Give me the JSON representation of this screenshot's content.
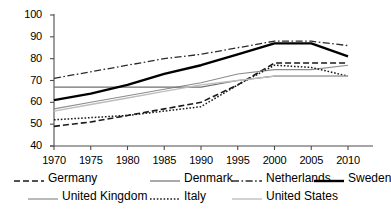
{
  "chart_data": {
    "type": "line",
    "title": "",
    "xlabel": "",
    "ylabel": "",
    "x": [
      1970,
      1975,
      1980,
      1985,
      1990,
      1995,
      2000,
      2005,
      2010
    ],
    "xlim": [
      1968,
      2012
    ],
    "ylim": [
      40,
      100
    ],
    "yticks": [
      40,
      50,
      60,
      70,
      80,
      90,
      100
    ],
    "xticks": [
      1970,
      1975,
      1980,
      1985,
      1990,
      1995,
      2000,
      2005,
      2010
    ],
    "grid": false,
    "legend_position": "below",
    "series": [
      {
        "name": "Germany",
        "style": "dashed",
        "color": "#1a1a1a",
        "width": 1.6,
        "values": [
          49,
          51,
          54,
          57,
          60,
          68,
          78,
          78,
          78
        ]
      },
      {
        "name": "United Kingdom",
        "style": "solid",
        "color": "#8c8c8c",
        "width": 1.1,
        "values": [
          57,
          60,
          63,
          66,
          69,
          73,
          75,
          75,
          77
        ]
      },
      {
        "name": "Denmark",
        "style": "solid",
        "color": "#707070",
        "width": 1.2,
        "values": [
          67,
          67,
          67,
          67,
          67,
          70,
          72,
          72,
          72
        ]
      },
      {
        "name": "Italy",
        "style": "dotted",
        "color": "#1a1a1a",
        "width": 1.5,
        "values": [
          52,
          53,
          54,
          56,
          58,
          68,
          77,
          76,
          72
        ]
      },
      {
        "name": "Netherlands",
        "style": "dash-dot",
        "color": "#2b2b2b",
        "width": 1.3,
        "values": [
          71,
          74,
          77,
          80,
          82,
          85,
          88,
          88,
          86
        ]
      },
      {
        "name": "United States",
        "style": "solid",
        "color": "#bdbdbd",
        "width": 1.4,
        "values": [
          56,
          59,
          62,
          65,
          68,
          70,
          72,
          72,
          72
        ]
      },
      {
        "name": "Sweden",
        "style": "solid",
        "color": "#000000",
        "width": 2.4,
        "values": [
          61,
          64,
          68,
          73,
          77,
          82,
          87,
          87,
          81
        ]
      }
    ]
  },
  "axes": {
    "y_tick_labels": [
      "100",
      "90",
      "80",
      "70",
      "60",
      "50",
      "40"
    ],
    "x_tick_labels": [
      "1970",
      "1975",
      "1980",
      "1985",
      "1990",
      "1995",
      "2000",
      "2005",
      "2010"
    ]
  },
  "legend": {
    "row1": [
      {
        "label": "Germany",
        "series": "Germany"
      },
      {
        "label": "Denmark",
        "series": "Denmark"
      },
      {
        "label": "Netherlands",
        "series": "Netherlands"
      },
      {
        "label": "Sweden",
        "series": "Sweden"
      }
    ],
    "row2": [
      {
        "label": "United Kingdom",
        "series": "United Kingdom"
      },
      {
        "label": "Italy",
        "series": "Italy"
      },
      {
        "label": "United States",
        "series": "United States"
      }
    ]
  }
}
